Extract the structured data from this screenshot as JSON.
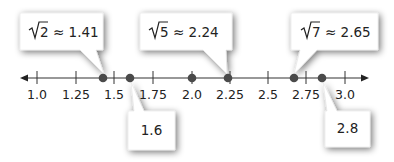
{
  "diagram": {
    "type": "number-line",
    "axis": {
      "min": 1.0,
      "max": 3.0,
      "tick_step": 0.25,
      "ticks": [
        {
          "value": 1.0,
          "label": "1.0"
        },
        {
          "value": 1.25,
          "label": "1.25"
        },
        {
          "value": 1.5,
          "label": "1.5"
        },
        {
          "value": 1.75,
          "label": "1.75"
        },
        {
          "value": 2.0,
          "label": "2.0"
        },
        {
          "value": 2.25,
          "label": "2.25"
        },
        {
          "value": 2.5,
          "label": "2.5"
        },
        {
          "value": 2.75,
          "label": "2.75"
        },
        {
          "value": 3.0,
          "label": "3.0"
        }
      ],
      "arrows": [
        "left",
        "right"
      ]
    },
    "points": [
      {
        "value": 1.41,
        "color": "#555555"
      },
      {
        "value": 1.6,
        "color": "#555555"
      },
      {
        "value": 2.0,
        "color": "#555555"
      },
      {
        "value": 2.24,
        "color": "#555555"
      },
      {
        "value": 2.65,
        "color": "#555555"
      },
      {
        "value": 2.8,
        "color": "#555555"
      }
    ],
    "callouts": [
      {
        "id": "sqrt2",
        "radicand": "2",
        "approx": "≈ 1.41",
        "points_to": 1.41,
        "position": "above"
      },
      {
        "id": "sqrt5",
        "radicand": "5",
        "approx": "≈ 2.24",
        "points_to": 2.24,
        "position": "above"
      },
      {
        "id": "sqrt7",
        "radicand": "7",
        "approx": "≈ 2.65",
        "points_to": 2.65,
        "position": "above"
      },
      {
        "id": "v16",
        "label": "1.6",
        "points_to": 1.6,
        "position": "below"
      },
      {
        "id": "v28",
        "label": "2.8",
        "points_to": 2.8,
        "position": "below"
      }
    ],
    "colors": {
      "axis": "#333333",
      "point": "#555555",
      "callout_fill": "#ffffff",
      "callout_shadow": "#9a9a9a"
    }
  }
}
